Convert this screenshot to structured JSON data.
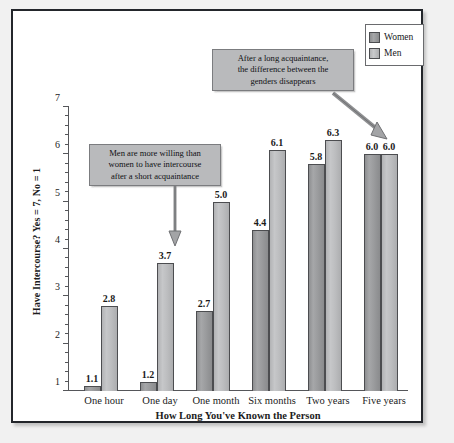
{
  "chart_data": {
    "type": "bar",
    "title": "",
    "xlabel": "How Long You've Known the Person",
    "ylabel": "Have Intercourse? Yes = 7, No = 1",
    "categories": [
      "One hour",
      "One day",
      "One month",
      "Six months",
      "Two years",
      "Five years"
    ],
    "series": [
      {
        "name": "Women",
        "color": "#9a9b9d",
        "values": [
          1.1,
          1.2,
          2.7,
          4.4,
          5.8,
          6.0
        ]
      },
      {
        "name": "Men",
        "color": "#bcbdbf",
        "values": [
          2.8,
          3.7,
          5.0,
          6.1,
          6.3,
          6.0
        ]
      }
    ],
    "value_labels": {
      "women": [
        "1.1",
        "1.2",
        "2.7",
        "4.4",
        "5.8",
        "6.0"
      ],
      "men": [
        "2.8",
        "3.7",
        "5.0",
        "6.1",
        "6.3",
        "6.0"
      ]
    },
    "ylim": [
      1,
      7
    ],
    "ytick_labels": [
      "1",
      "2",
      "3",
      "4",
      "5",
      "6",
      "7"
    ],
    "yticks_major": [
      1,
      2,
      3,
      4,
      5,
      6,
      7
    ],
    "ytick_minor_step": 0.2,
    "grid": false,
    "legend": {
      "position": "top-right",
      "entries": [
        {
          "label": "Women",
          "color": "#9a9b9d"
        },
        {
          "label": "Men",
          "color": "#bcbdbf"
        }
      ]
    },
    "annotations": [
      {
        "id": "short-acquaintance",
        "text": "Men are more willing than women to have intercourse after a short acquaintance",
        "lines": [
          "Men are more willing than",
          "women to have intercourse",
          "after a short acquaintance"
        ],
        "points_to": "One day",
        "arrow": "down"
      },
      {
        "id": "long-acquaintance",
        "text": "After a long acquaintance, the difference between the genders disappears",
        "lines": [
          "After a long acquaintance,",
          "the difference between the",
          "genders disappears"
        ],
        "points_to": "Five years",
        "arrow": "diagonal-down-right"
      }
    ]
  },
  "colors": {
    "women_bar": "#9a9b9d",
    "men_bar": "#bcbdbf",
    "callout_bg": "#b9babc",
    "frame_border": "#23262b",
    "axis": "#55565a",
    "page_bg": "#f1f1f1"
  }
}
